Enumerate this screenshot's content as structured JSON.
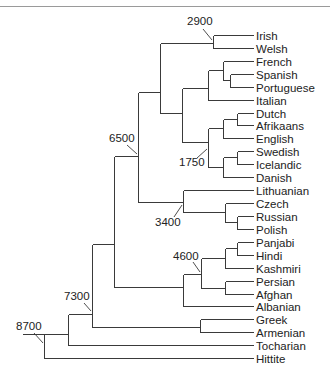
{
  "figure": {
    "leaf_line_end_x": 253,
    "leaf_label_x": 256,
    "line_color": "#3a3a3a",
    "text_color": "#222222"
  },
  "leaves": [
    {
      "name": "Irish",
      "y": 35
    },
    {
      "name": "Welsh",
      "y": 48
    },
    {
      "name": "French",
      "y": 61
    },
    {
      "name": "Spanish",
      "y": 74
    },
    {
      "name": "Portuguese",
      "y": 87
    },
    {
      "name": "Italian",
      "y": 100
    },
    {
      "name": "Dutch",
      "y": 113
    },
    {
      "name": "Afrikaans",
      "y": 125
    },
    {
      "name": "English",
      "y": 138
    },
    {
      "name": "Swedish",
      "y": 151
    },
    {
      "name": "Icelandic",
      "y": 164
    },
    {
      "name": "Danish",
      "y": 177
    },
    {
      "name": "Lithuanian",
      "y": 190
    },
    {
      "name": "Czech",
      "y": 203
    },
    {
      "name": "Russian",
      "y": 216
    },
    {
      "name": "Polish",
      "y": 229
    },
    {
      "name": "Panjabi",
      "y": 242
    },
    {
      "name": "Hindi",
      "y": 255
    },
    {
      "name": "Kashmiri",
      "y": 268
    },
    {
      "name": "Persian",
      "y": 281
    },
    {
      "name": "Afghan",
      "y": 294
    },
    {
      "name": "Albanian",
      "y": 306
    },
    {
      "name": "Greek",
      "y": 319
    },
    {
      "name": "Armenian",
      "y": 332
    },
    {
      "name": "Tocharian",
      "y": 345
    },
    {
      "name": "Hittite",
      "y": 358
    }
  ],
  "leaf_attach_x": {
    "Irish": 213,
    "Welsh": 213,
    "French": 223,
    "Spanish": 230,
    "Portuguese": 230,
    "Italian": 208,
    "Dutch": 237,
    "Afrikaans": 237,
    "English": 223,
    "Swedish": 237,
    "Icelandic": 237,
    "Danish": 223,
    "Lithuanian": 183,
    "Czech": 225,
    "Russian": 237,
    "Polish": 237,
    "Panjabi": 237,
    "Hindi": 237,
    "Kashmiri": 225,
    "Persian": 225,
    "Afghan": 225,
    "Albanian": 183,
    "Greek": 200,
    "Armenian": 200,
    "Tocharian": 68,
    "Hittite": 44
  },
  "internal_edges": [
    {
      "id": "celtic",
      "x": 213,
      "y1": 35,
      "y2": 48
    },
    {
      "id": "sp-pt",
      "x": 230,
      "y1": 74,
      "y2": 87
    },
    {
      "id": "fr-sppt",
      "x": 223,
      "y1": 61,
      "y2": 80
    },
    {
      "id": "romance",
      "x": 208,
      "y1": 70,
      "y2": 100
    },
    {
      "id": "du-af",
      "x": 237,
      "y1": 113,
      "y2": 125
    },
    {
      "id": "west-germanic",
      "x": 223,
      "y1": 119,
      "y2": 138
    },
    {
      "id": "sw-ic",
      "x": 237,
      "y1": 151,
      "y2": 164
    },
    {
      "id": "north-germanic",
      "x": 223,
      "y1": 157,
      "y2": 177
    },
    {
      "id": "germanic",
      "x": 208,
      "y1": 128,
      "y2": 167
    },
    {
      "id": "romance-germanic",
      "x": 182,
      "y1": 88,
      "y2": 142
    },
    {
      "id": "celtic-italic-germanic",
      "x": 160,
      "y1": 43,
      "y2": 113
    },
    {
      "id": "ru-pl",
      "x": 237,
      "y1": 216,
      "y2": 229
    },
    {
      "id": "slavic",
      "x": 225,
      "y1": 203,
      "y2": 222
    },
    {
      "id": "balto-slavic",
      "x": 183,
      "y1": 190,
      "y2": 212
    },
    {
      "id": "node-6500",
      "x": 138,
      "y1": 92,
      "y2": 202
    },
    {
      "id": "pa-hi",
      "x": 237,
      "y1": 242,
      "y2": 255
    },
    {
      "id": "indic",
      "x": 225,
      "y1": 248,
      "y2": 268
    },
    {
      "id": "iranian",
      "x": 225,
      "y1": 281,
      "y2": 294
    },
    {
      "id": "indo-iranian",
      "x": 201,
      "y1": 258,
      "y2": 288
    },
    {
      "id": "indo-iranian-albanian",
      "x": 183,
      "y1": 274,
      "y2": 306
    },
    {
      "id": "node-114",
      "x": 114,
      "y1": 156,
      "y2": 287
    },
    {
      "id": "greek-armenian",
      "x": 200,
      "y1": 319,
      "y2": 332
    },
    {
      "id": "node-7300",
      "x": 92,
      "y1": 244,
      "y2": 327
    },
    {
      "id": "node-68",
      "x": 68,
      "y1": 314,
      "y2": 345
    },
    {
      "id": "root-8700",
      "x": 44,
      "y1": 334,
      "y2": 358
    }
  ],
  "horizontal_connectors": [
    {
      "x1": 160,
      "x2": 213,
      "y": 43
    },
    {
      "x1": 208,
      "x2": 223,
      "y": 70
    },
    {
      "x1": 223,
      "x2": 230,
      "y": 80
    },
    {
      "x1": 182,
      "x2": 208,
      "y": 88
    },
    {
      "x1": 160,
      "x2": 182,
      "y": 113
    },
    {
      "x1": 208,
      "x2": 223,
      "y": 128
    },
    {
      "x1": 223,
      "x2": 237,
      "y": 119
    },
    {
      "x1": 182,
      "x2": 208,
      "y": 142
    },
    {
      "x1": 223,
      "x2": 237,
      "y": 157
    },
    {
      "x1": 208,
      "x2": 223,
      "y": 167
    },
    {
      "x1": 138,
      "x2": 160,
      "y": 92
    },
    {
      "x1": 138,
      "x2": 183,
      "y": 202
    },
    {
      "x1": 183,
      "x2": 225,
      "y": 212
    },
    {
      "x1": 225,
      "x2": 237,
      "y": 222
    },
    {
      "x1": 114,
      "x2": 138,
      "y": 156
    },
    {
      "x1": 225,
      "x2": 237,
      "y": 248
    },
    {
      "x1": 201,
      "x2": 225,
      "y": 258
    },
    {
      "x1": 201,
      "x2": 225,
      "y": 288
    },
    {
      "x1": 183,
      "x2": 201,
      "y": 274
    },
    {
      "x1": 114,
      "x2": 183,
      "y": 287
    },
    {
      "x1": 92,
      "x2": 114,
      "y": 244
    },
    {
      "x1": 92,
      "x2": 200,
      "y": 327
    },
    {
      "x1": 68,
      "x2": 92,
      "y": 314
    },
    {
      "x1": 44,
      "x2": 68,
      "y": 334
    },
    {
      "x1": 22,
      "x2": 44,
      "y": 334
    }
  ],
  "date_labels": [
    {
      "text": "2900",
      "x": 187,
      "y": 25,
      "arrow": [
        203,
        29,
        212,
        40
      ]
    },
    {
      "text": "6500",
      "x": 109,
      "y": 142,
      "arrow": [
        127,
        145,
        137,
        154
      ]
    },
    {
      "text": "1750",
      "x": 179,
      "y": 166,
      "arrow": [
        197,
        158,
        207,
        149
      ]
    },
    {
      "text": "3400",
      "x": 155,
      "y": 226,
      "arrow": [
        174,
        217,
        182,
        205
      ]
    },
    {
      "text": "4600",
      "x": 173,
      "y": 260,
      "arrow": [
        193,
        262,
        200,
        272
      ]
    },
    {
      "text": "7300",
      "x": 64,
      "y": 300,
      "arrow": [
        84,
        303,
        91,
        311
      ]
    },
    {
      "text": "8700",
      "x": 16,
      "y": 330,
      "arrow": [
        34,
        333,
        43,
        343
      ]
    }
  ]
}
